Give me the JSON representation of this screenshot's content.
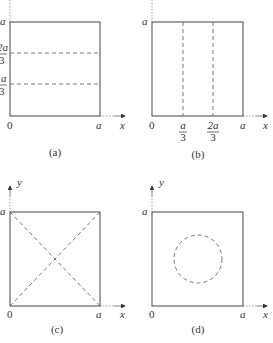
{
  "panels": [
    {
      "id": "a",
      "caption": "(a)",
      "origin_label": "0",
      "x_end_label": "a",
      "x_axis_label": "x",
      "y_end_label": "a",
      "y_axis_label": "",
      "y_ticks": [
        {
          "num": "2a",
          "den": "3"
        },
        {
          "num": "a",
          "den": "3"
        }
      ],
      "partition": "two horizontal dashed lines at y = a/3 and y = 2a/3"
    },
    {
      "id": "b",
      "caption": "(b)",
      "origin_label": "0",
      "x_end_label": "a",
      "x_axis_label": "x",
      "y_end_label": "a",
      "y_axis_label": "",
      "x_ticks": [
        {
          "num": "a",
          "den": "3"
        },
        {
          "num": "2a",
          "den": "3"
        }
      ],
      "partition": "two vertical dashed lines at x = a/3 and x = 2a/3"
    },
    {
      "id": "c",
      "caption": "(c)",
      "origin_label": "0",
      "x_end_label": "a",
      "x_axis_label": "x",
      "y_end_label": "a",
      "y_axis_label": "y",
      "partition": "two dashed diagonals"
    },
    {
      "id": "d",
      "caption": "(d)",
      "origin_label": "0",
      "x_end_label": "a",
      "x_axis_label": "x",
      "y_end_label": "a",
      "y_axis_label": "y",
      "partition": "dashed circle centered in square"
    }
  ]
}
